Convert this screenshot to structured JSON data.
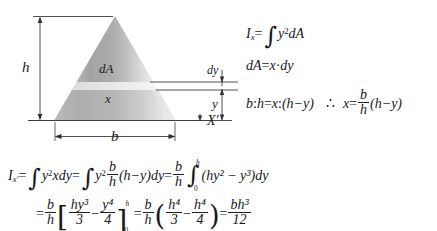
{
  "figure": {
    "type": "engineering-diagram",
    "diagram": {
      "shape_name": "triangle",
      "labels": {
        "height": "h",
        "base": "b",
        "element_area": "dA",
        "element_width": "x",
        "element_thickness": "dy",
        "element_distance": "y",
        "axis": "X′"
      },
      "colors": {
        "fill_dark": "#9a9a9a",
        "fill_light": "#d9d9d9",
        "line": "#3a3a3a",
        "strip_highlight": "#e8e8e8",
        "background": "#ffffff"
      },
      "geometry_note": "apex at top center, base on axis X', horizontal strip dA of thickness dy at distance y above the base"
    },
    "equations": [
      {
        "id": "eq-ix-definition",
        "text": "I_x = ∫ y² dA",
        "parts": {
          "lhs_symbol": "I",
          "lhs_sub": "x",
          "integrand_var": "y",
          "integrand_exp": "2",
          "differential": "dA"
        }
      },
      {
        "id": "eq-da",
        "text": "dA = x·dy",
        "parts": {
          "lhs": "dA",
          "rhs_left": "x",
          "operator": "·",
          "rhs_right": "dy"
        }
      },
      {
        "id": "eq-proportion",
        "text": "b : h = x : (h − y)   ∴  x = (b/h)(h − y)",
        "parts": {
          "ratio_left_a": "b",
          "ratio_left_b": "h",
          "ratio_right_a": "x",
          "ratio_right_b": "(h−y)",
          "therefore": "∴",
          "solved_lhs": "x",
          "frac_num": "b",
          "frac_den": "h",
          "factor": "(h−y)"
        }
      },
      {
        "id": "eq-integration-setup",
        "text": "I_x' = ∫ y² x dy = ∫ y² (b/h)(h−y) dy = (b/h) ∫₀ʰ (hy² − y³) dy",
        "parts": {
          "lhs_symbol": "I",
          "lhs_sub": "x′",
          "limit_lower": "0",
          "limit_upper": "h",
          "frac_num": "b",
          "frac_den": "h",
          "integrand": "(hy² − y³)dy"
        }
      },
      {
        "id": "eq-result",
        "text": "= (b/h)[ hy³/3 − y⁴/4 ]₀ʰ = (b/h)( h⁴/3 − h⁴/4 ) = bh³/12",
        "parts": {
          "frac_num": "b",
          "frac_den": "h",
          "bracket_term_1_num": "hy³",
          "bracket_term_1_den": "3",
          "bracket_term_2_num": "y⁴",
          "bracket_term_2_den": "4",
          "eval_lower": "0",
          "eval_upper": "h",
          "paren_term_1_num": "h⁴",
          "paren_term_1_den": "3",
          "paren_term_2_num": "h⁴",
          "paren_term_2_den": "4",
          "result_num": "bh³",
          "result_den": "12"
        }
      }
    ],
    "glyphs": {
      "integral": "∫",
      "minus": "−",
      "equals": "=",
      "cdot": "·",
      "colon": ":",
      "therefore": "∴",
      "prime": "′",
      "lbracket": "[",
      "rbracket": "]",
      "lparen": "(",
      "rparen": ")",
      "exp2": "2",
      "exp3": "3",
      "exp4": "4"
    }
  }
}
